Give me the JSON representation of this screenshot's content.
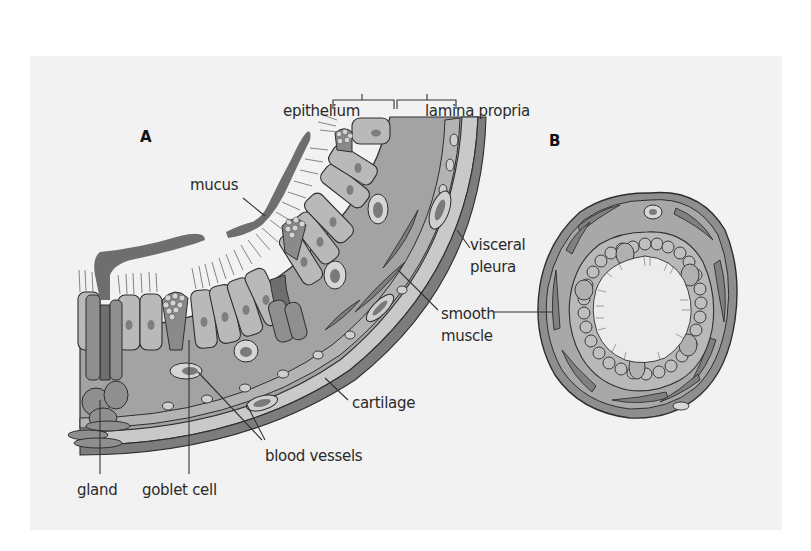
{
  "figure": {
    "panels": [
      {
        "id": "A",
        "label": "A"
      },
      {
        "id": "B",
        "label": "B"
      }
    ],
    "labels": {
      "epithelium": "epithelium",
      "lamina_propria": "lamina propria",
      "mucus": "mucus",
      "visceral_pleura_line1": "visceral",
      "visceral_pleura_line2": "pleura",
      "smooth_muscle_line1": "smooth",
      "smooth_muscle_line2": "muscle",
      "cartilage": "cartilage",
      "blood_vessels": "blood vessels",
      "gland": "gland",
      "goblet_cell": "goblet cell"
    },
    "colors": {
      "background": "#ffffff",
      "panel": "#f2f2f2",
      "tissue_light": "#b8b8b8",
      "tissue_mid": "#9a9a9a",
      "tissue_dark": "#7a7a7a",
      "mucus": "#6e6e6e",
      "outline": "#2e2e2e",
      "lumen": "#ececec"
    }
  }
}
